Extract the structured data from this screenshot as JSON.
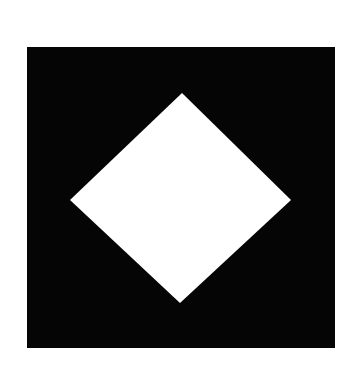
{
  "image": {
    "background_color": "#ffffff",
    "square": {
      "color": "#050505",
      "label": "black square"
    },
    "diamond": {
      "color": "#ffffff",
      "label": "white diamond",
      "points": "182,93 291,200 180,303 70,200"
    }
  }
}
